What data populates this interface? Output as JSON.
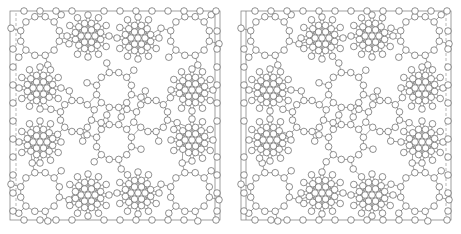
{
  "figure": {
    "colors": {
      "edge": "#555555",
      "node_stroke": "#444444",
      "node_fill": "#ffffff",
      "frame": "#777777",
      "background": "#ffffff"
    },
    "node_radius": 3.3,
    "panels": [
      {
        "id": "left",
        "frame": {
          "x": 10,
          "y": 11,
          "w": 210,
          "h": 209
        },
        "inner_frame_x": 215,
        "dashed_line_x": 16,
        "hubs": [
          [
            88,
            36
          ],
          [
            138,
            38
          ],
          [
            40,
            88
          ],
          [
            192,
            90
          ],
          [
            40,
            142
          ],
          [
            192,
            140
          ],
          [
            88,
            195
          ],
          [
            138,
            193
          ]
        ],
        "rings": [
          [
            40,
            36,
            20
          ],
          [
            190,
            36,
            20
          ],
          [
            114,
            90,
            18
          ],
          [
            114,
            142,
            18
          ],
          [
            40,
            192,
            20
          ],
          [
            190,
            192,
            20
          ],
          [
            76,
            116,
            16
          ],
          [
            152,
            116,
            16
          ]
        ]
      },
      {
        "id": "right",
        "frame": {
          "x": 241,
          "y": 11,
          "w": 210,
          "h": 209
        },
        "inner_frame_x": 246,
        "dashed_line_x": 446,
        "hubs": [
          [
            322,
            38
          ],
          [
            372,
            36
          ],
          [
            270,
            90
          ],
          [
            422,
            88
          ],
          [
            270,
            140
          ],
          [
            422,
            142
          ],
          [
            322,
            193
          ],
          [
            372,
            195
          ]
        ],
        "rings": [
          [
            270,
            36,
            20
          ],
          [
            420,
            36,
            20
          ],
          [
            346,
            90,
            18
          ],
          [
            346,
            142,
            18
          ],
          [
            270,
            192,
            20
          ],
          [
            420,
            192,
            20
          ],
          [
            308,
            116,
            16
          ],
          [
            384,
            116,
            16
          ]
        ]
      }
    ]
  }
}
